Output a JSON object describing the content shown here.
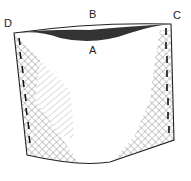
{
  "diagram": {
    "labels": [
      {
        "id": "D",
        "text": "D",
        "x": 4,
        "y": 27
      },
      {
        "id": "B",
        "text": "B",
        "x": 89,
        "y": 18
      },
      {
        "id": "C",
        "text": "C",
        "x": 173,
        "y": 19
      },
      {
        "id": "A",
        "text": "A",
        "x": 89,
        "y": 54
      }
    ],
    "colors": {
      "line": "#222222",
      "hatch": "#555555",
      "background": "#ffffff"
    }
  }
}
